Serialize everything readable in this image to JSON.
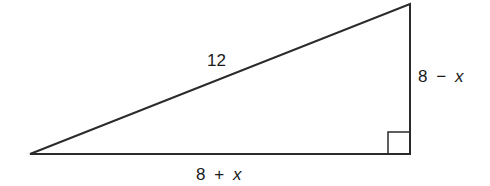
{
  "diagram": {
    "type": "right-triangle",
    "stroke_color": "#2b2b2b",
    "background": "#ffffff",
    "vertices": {
      "left": [
        30,
        154
      ],
      "top_right": [
        410,
        4
      ],
      "right_angle": [
        410,
        154
      ]
    },
    "right_angle_marker": {
      "x": 388,
      "y": 132,
      "size": 22
    },
    "labels": {
      "hypotenuse": {
        "text": "12",
        "x": 207,
        "y": 66
      },
      "vertical_leg": {
        "number": "8",
        "operator": "−",
        "variable": "x",
        "x": 418,
        "y": 82
      },
      "horizontal_leg": {
        "number": "8",
        "operator": "+",
        "variable": "x",
        "x": 196,
        "y": 180
      }
    }
  }
}
